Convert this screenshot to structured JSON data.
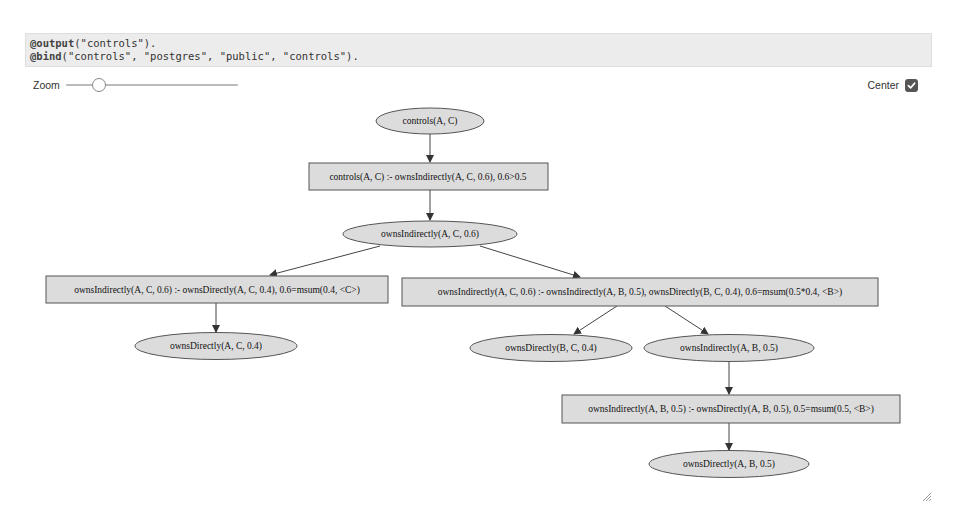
{
  "code": {
    "lines": [
      {
        "keyword": "@output",
        "rest": "(\"controls\")."
      },
      {
        "keyword": "@bind",
        "rest": "(\"controls\", \"postgres\", \"public\", \"controls\")."
      }
    ]
  },
  "controls": {
    "zoom_label": "Zoom",
    "zoom_value_percent": 15,
    "center_label": "Center",
    "center_checked": true
  },
  "graph": {
    "node_fill": "#dcdcdc",
    "node_stroke": "#555555",
    "nodes": [
      {
        "id": "n1",
        "shape": "ellipse",
        "label": "controls(A, C)"
      },
      {
        "id": "r1",
        "shape": "rect",
        "label": "controls(A, C) :- ownsIndirectly(A, C, 0.6), 0.6>0.5"
      },
      {
        "id": "n2",
        "shape": "ellipse",
        "label": "ownsIndirectly(A, C, 0.6)"
      },
      {
        "id": "r2",
        "shape": "rect",
        "label": "ownsIndirectly(A, C, 0.6) :- ownsDirectly(A, C, 0.4), 0.6=msum(0.4, <C>)"
      },
      {
        "id": "r3",
        "shape": "rect",
        "label": "ownsIndirectly(A, C, 0.6) :- ownsIndirectly(A, B, 0.5), ownsDirectly(B, C, 0.4), 0.6=msum(0.5*0.4, <B>)"
      },
      {
        "id": "n3",
        "shape": "ellipse",
        "label": "ownsDirectly(A, C, 0.4)"
      },
      {
        "id": "n4",
        "shape": "ellipse",
        "label": "ownsDirectly(B, C, 0.4)"
      },
      {
        "id": "n5",
        "shape": "ellipse",
        "label": "ownsIndirectly(A, B, 0.5)"
      },
      {
        "id": "r4",
        "shape": "rect",
        "label": "ownsIndirectly(A, B, 0.5) :- ownsDirectly(A, B, 0.5), 0.5=msum(0.5, <B>)"
      },
      {
        "id": "n6",
        "shape": "ellipse",
        "label": "ownsDirectly(A, B, 0.5)"
      }
    ],
    "edges": [
      [
        "n1",
        "r1"
      ],
      [
        "r1",
        "n2"
      ],
      [
        "n2",
        "r2"
      ],
      [
        "n2",
        "r3"
      ],
      [
        "r2",
        "n3"
      ],
      [
        "r3",
        "n4"
      ],
      [
        "r3",
        "n5"
      ],
      [
        "n5",
        "r4"
      ],
      [
        "r4",
        "n6"
      ]
    ]
  }
}
